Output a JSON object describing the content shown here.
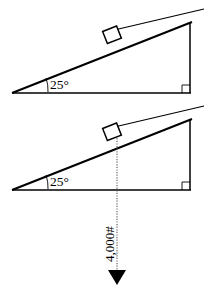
{
  "figure": {
    "background_color": "#ffffff",
    "line_color": "#000000",
    "dashed_color": "#555555",
    "width": 211,
    "height": 293
  },
  "diagram_top": {
    "name": "inclined-plane-top",
    "angle_label": "25°",
    "angle_value": 25,
    "right_angle_marker": true,
    "block_label": "",
    "cable_line": true,
    "apex_point": [
      12,
      93
    ],
    "base_right_point": [
      190,
      93
    ],
    "top_right_point": [
      190,
      23
    ],
    "block_center": [
      113,
      36
    ]
  },
  "diagram_bottom": {
    "name": "inclined-plane-bottom",
    "angle_label": "25°",
    "angle_value": 25,
    "right_angle_marker": true,
    "cable_line": true,
    "apex_point": [
      12,
      190
    ],
    "base_right_point": [
      190,
      190
    ],
    "top_right_point": [
      190,
      120
    ],
    "block_center": [
      113,
      133
    ],
    "force": {
      "label": "4,000#",
      "magnitude": "4,000",
      "unit": "#",
      "direction": "down",
      "arrow_from": [
        117,
        133
      ],
      "arrow_to": [
        117,
        285
      ],
      "label_rotated": true
    }
  }
}
